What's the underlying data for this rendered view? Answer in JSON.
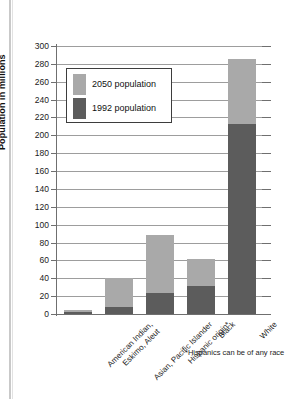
{
  "chart_data": {
    "type": "bar",
    "title": "",
    "subtitle": "",
    "xlabel": "",
    "ylabel": "Population in millions",
    "ylim": [
      0,
      300
    ],
    "ytick_step": 20,
    "yticks": [
      0,
      20,
      40,
      60,
      80,
      100,
      120,
      140,
      160,
      180,
      200,
      220,
      240,
      260,
      280,
      300
    ],
    "ytick_labels": [
      "0",
      "20",
      "40",
      "60",
      "80",
      "100",
      "120",
      "140",
      "160",
      "180",
      "200",
      "220",
      "240",
      "260",
      "280",
      "300"
    ],
    "grid": true,
    "stacked": true,
    "legend_position": "upper-left-inset",
    "categories": [
      "American Indian,\nEskimo, Aleut",
      "Asian, Pacific Islander",
      "Hispanic origin*",
      "Black",
      "White"
    ],
    "category_lines": [
      [
        "American Indian,",
        "Eskimo, Aleut"
      ],
      [
        "Asian, Pacific Islander"
      ],
      [
        "Hispanic origin*"
      ],
      [
        "Black"
      ],
      [
        "White"
      ]
    ],
    "series": [
      {
        "name": "1992 population",
        "color": "#5c5c5c",
        "values": [
          2,
          8,
          24,
          31,
          213
        ]
      },
      {
        "name": "2050 population",
        "color": "#a9a9a9",
        "values": [
          4,
          40,
          88,
          62,
          286
        ]
      }
    ],
    "annotations": [
      "*Hispanics can be of any race"
    ]
  },
  "legend": {
    "items": [
      {
        "label": "2050 population",
        "color": "#a9a9a9"
      },
      {
        "label": "1992 population",
        "color": "#5c5c5c"
      }
    ]
  },
  "axis": {
    "y_title": "Population in millions"
  },
  "footnote": {
    "text": "*Hispanics can be of any race"
  }
}
